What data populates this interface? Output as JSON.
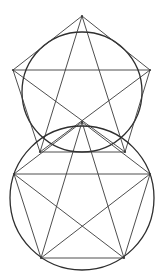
{
  "figure": {
    "type": "geometric-construction",
    "stroke_color": "#3a3a3a",
    "circle_color": "#2e2e2e",
    "background": "#ffffff",
    "upper": {
      "circle": {
        "cx": 82,
        "cy": 92,
        "r": 60
      },
      "pentagon": [
        [
          82,
          16
        ],
        [
          150,
          70
        ],
        [
          125,
          152
        ],
        [
          40,
          152
        ],
        [
          13,
          70
        ]
      ]
    },
    "lower": {
      "circle": {
        "cx": 82,
        "cy": 198,
        "r": 72
      },
      "pentagon": [
        [
          82,
          122
        ],
        [
          150,
          174
        ],
        [
          124,
          258
        ],
        [
          41,
          258
        ],
        [
          14,
          174
        ]
      ]
    }
  }
}
